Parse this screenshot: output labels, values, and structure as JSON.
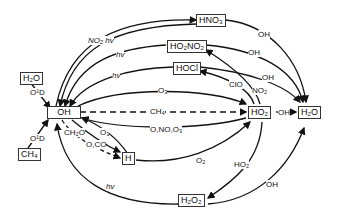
{
  "species": {
    "h2o_left": "H₂O",
    "ch4": "CH₄",
    "oh": "OH",
    "hno3": "HNO₃",
    "ho2no2": "HO₂NO₂",
    "hocl": "HOCl",
    "ho2": "HO₂",
    "h2o_right": "H₂O",
    "h": "H",
    "h2o2": "H₂O₂"
  },
  "reactants": {
    "o1d_top": "O¹D",
    "o1d_bottom": "O¹D",
    "no2_hv": "NO₂ hv",
    "hv_ho2no2": "hv",
    "hv_hocl": "hv",
    "o3_top": "O₃",
    "ch4_dashed": "CH₄",
    "o_no_o3": "O,NO,O₃",
    "ch2o": "CH₂O",
    "o3_h": "O₃",
    "o_co": "O,CO",
    "o2": "O₂",
    "hv_bottom": "hv",
    "oh_hno3": "OH",
    "oh_ho2no2": "OH",
    "oh_hocl": "OH",
    "clo": "ClO",
    "no2": "NO₂",
    "oh_ho2": "OH",
    "ho2_h2o2": "HO₂",
    "oh_h2o2": "OH"
  }
}
